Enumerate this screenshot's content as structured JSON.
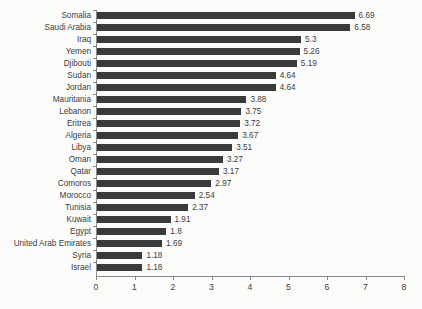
{
  "chart_data": {
    "type": "bar",
    "orientation": "horizontal",
    "title": "",
    "subtitle": "",
    "xlabel": "",
    "ylabel": "",
    "xlim": [
      0,
      8
    ],
    "xticks": [
      0,
      1,
      2,
      3,
      4,
      5,
      6,
      7,
      8
    ],
    "grid": false,
    "legend": false,
    "bar_color": "#3a3a3a",
    "axis_color": "#8a8a8a",
    "background_color": "#fbfbfa",
    "text_color": "#3d3d3d",
    "categories": [
      "Somalia",
      "Saudi Arabia",
      "Iraq",
      "Yemen",
      "Djibouti",
      "Sudan",
      "Jordan",
      "Mauritania",
      "Lebanon",
      "Eritrea",
      "Algeria",
      "Libya",
      "Oman",
      "Qatar",
      "Comoros",
      "Morocco",
      "Tunisia",
      "Kuwait",
      "Egypt",
      "United Arab Emirates",
      "Syria",
      "Israel"
    ],
    "values": [
      6.69,
      6.58,
      5.3,
      5.26,
      5.19,
      4.64,
      4.64,
      3.88,
      3.75,
      3.72,
      3.67,
      3.51,
      3.27,
      3.17,
      2.97,
      2.54,
      2.37,
      1.91,
      1.8,
      1.69,
      1.18,
      1.18
    ],
    "value_labels": [
      "6.69",
      "6.58",
      "5.3",
      "5.26",
      "5.19",
      "4.64",
      "4.64",
      "3.88",
      "3.75",
      "3.72",
      "3.67",
      "3.51",
      "3.27",
      "3.17",
      "2.97",
      "2.54",
      "2.37",
      "1.91",
      "1.8",
      "1.69",
      "1.18",
      "1.18"
    ],
    "xtick_labels": [
      "0",
      "1",
      "2",
      "3",
      "4",
      "5",
      "6",
      "7",
      "8"
    ]
  }
}
